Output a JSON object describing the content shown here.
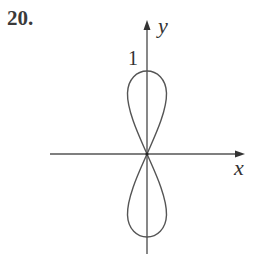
{
  "problem": {
    "number": "20."
  },
  "figure": {
    "x_axis_label": "x",
    "y_axis_label": "y",
    "tick_label_top": "1",
    "colors": {
      "stroke": "#555555",
      "text": "#333333",
      "background": "#ffffff"
    }
  }
}
